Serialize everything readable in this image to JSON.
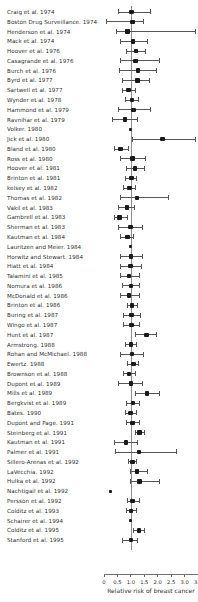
{
  "chart_data": {
    "type": "scatter",
    "plot_kind": "forest-plot",
    "title": "",
    "xlabel": "Relative risk of breast cancer",
    "ylabel": "",
    "xlim": [
      0,
      3.5
    ],
    "xticks": [
      0,
      0.5,
      1.0,
      1.5,
      2.0,
      2.5,
      3.0,
      3.5
    ],
    "xticklabels": [
      "0",
      "0.5",
      "1.0",
      "1.5",
      "2.0",
      "2.5",
      "3.0",
      "3.5"
    ],
    "reference_line": 1.0,
    "grid": false,
    "legend": "none",
    "point_label": "Relative risk estimate",
    "interval_label": "95% confidence interval",
    "studies": [
      {
        "label": "Craig et al. 1974",
        "rr": 1.03,
        "lo": 0.55,
        "hi": 1.72
      },
      {
        "label": "Boston Drug Surveillance. 1974",
        "rr": 1.06,
        "lo": 0.1,
        "hi": 1.45
      },
      {
        "label": "Henderson et al. 1974",
        "rr": 0.88,
        "lo": 0.48,
        "hi": 3.42
      },
      {
        "label": "Mack et al. 1974",
        "rr": 1.08,
        "lo": 0.62,
        "hi": 1.6
      },
      {
        "label": "Hoover et al. 1976",
        "rr": 1.2,
        "lo": 0.85,
        "hi": 1.55
      },
      {
        "label": "Casagrande et al. 1976",
        "rr": 1.17,
        "lo": 0.62,
        "hi": 2.08
      },
      {
        "label": "Burch et al. 1976",
        "rr": 1.27,
        "lo": 0.59,
        "hi": 1.94
      },
      {
        "label": "Byrd et al. 1977",
        "rr": 1.25,
        "lo": 0.7,
        "hi": 1.69
      },
      {
        "label": "Sartwell et al. 1977",
        "rr": 0.91,
        "lo": 0.7,
        "hi": 1.17
      },
      {
        "label": "Wynder et al. 1978",
        "rr": 1.05,
        "lo": 0.8,
        "hi": 1.28
      },
      {
        "label": "Hammond et al. 1979",
        "rr": 1.1,
        "lo": 0.52,
        "hi": 1.72
      },
      {
        "label": "Ravnihar et al. 1979",
        "rr": 0.78,
        "lo": 0.3,
        "hi": 1.26
      },
      {
        "label": "Volker. 1980",
        "rr": 1.0,
        "lo": null,
        "hi": null
      },
      {
        "label": "Jick et al. 1980",
        "rr": 2.18,
        "lo": 1.05,
        "hi": 3.42
      },
      {
        "label": "Bland et al. 1980",
        "rr": 0.62,
        "lo": 0.37,
        "hi": 0.92
      },
      {
        "label": "Ross et al. 1980",
        "rr": 1.06,
        "lo": 0.62,
        "hi": 1.55
      },
      {
        "label": "Hoover et al. 1981",
        "rr": 1.16,
        "lo": 0.82,
        "hi": 1.5
      },
      {
        "label": "Brinton et al. 1981",
        "rr": 1.02,
        "lo": 0.8,
        "hi": 1.22
      },
      {
        "label": "kelsey et al. 1982",
        "rr": 0.95,
        "lo": 0.72,
        "hi": 1.18
      },
      {
        "label": "Thomas et al. 1982",
        "rr": 1.23,
        "lo": 0.62,
        "hi": 2.4
      },
      {
        "label": "Vakil et al. 1983",
        "rr": 0.85,
        "lo": 0.55,
        "hi": 1.14
      },
      {
        "label": "Gambrell et al. 1983",
        "rr": 0.58,
        "lo": 0.37,
        "hi": 0.86
      },
      {
        "label": "Sherman et al. 1983",
        "rr": 0.98,
        "lo": 0.55,
        "hi": 1.42
      },
      {
        "label": "Kautman et al. 1984",
        "rr": 0.88,
        "lo": 0.6,
        "hi": 1.08
      },
      {
        "label": "Lauritzen and Meier. 1984",
        "rr": 0.98,
        "lo": null,
        "hi": null
      },
      {
        "label": "Horwitz and Stewart. 1984",
        "rr": 1.0,
        "lo": 0.6,
        "hi": 1.44
      },
      {
        "label": "Hiatt et al. 1984",
        "rr": 0.98,
        "lo": 0.62,
        "hi": 1.38
      },
      {
        "label": "Talamini et al. 1985",
        "rr": 0.94,
        "lo": 0.62,
        "hi": 1.3
      },
      {
        "label": "Nomura et al. 1986",
        "rr": 1.0,
        "lo": 0.68,
        "hi": 1.32
      },
      {
        "label": "McDonald et al. 1986",
        "rr": 0.92,
        "lo": 0.6,
        "hi": 1.3
      },
      {
        "label": "Brinton et al. 1986",
        "rr": 1.05,
        "lo": 0.86,
        "hi": 1.24
      },
      {
        "label": "Buring et al. 1987",
        "rr": 1.02,
        "lo": 0.72,
        "hi": 1.36
      },
      {
        "label": "Wingo et al. 1987",
        "rr": 1.03,
        "lo": 0.72,
        "hi": 1.32
      },
      {
        "label": "Hunt et al. 1987",
        "rr": 1.58,
        "lo": 1.16,
        "hi": 1.95
      },
      {
        "label": "Armstrong. 1988",
        "rr": 1.0,
        "lo": 0.8,
        "hi": 1.22
      },
      {
        "label": "Rohan and McMichael. 1988",
        "rr": 1.04,
        "lo": 0.62,
        "hi": 1.48
      },
      {
        "label": "Ewertz. 1988",
        "rr": 1.1,
        "lo": 0.88,
        "hi": 1.28
      },
      {
        "label": "Brownson et al. 1988",
        "rr": 0.94,
        "lo": 0.72,
        "hi": 1.16
      },
      {
        "label": "Dupont et al. 1989",
        "rr": 1.0,
        "lo": 0.55,
        "hi": 1.42
      },
      {
        "label": "Mills et al. 1989",
        "rr": 1.6,
        "lo": 1.18,
        "hi": 2.08
      },
      {
        "label": "Bergkvist et al. 1989",
        "rr": 1.08,
        "lo": 0.82,
        "hi": 1.32
      },
      {
        "label": "Bates. 1990",
        "rr": 0.98,
        "lo": 0.78,
        "hi": 1.2
      },
      {
        "label": "Dupont and Page. 1991",
        "rr": 1.06,
        "lo": 0.82,
        "hi": 1.3
      },
      {
        "label": "Steinberg et al. 1991",
        "rr": 1.32,
        "lo": 1.16,
        "hi": 1.5
      },
      {
        "label": "Kautman et al. 1991",
        "rr": 0.82,
        "lo": 0.4,
        "hi": 1.26
      },
      {
        "label": "Palmer et al. 1991",
        "rr": 1.3,
        "lo": 0.42,
        "hi": 2.68
      },
      {
        "label": "Sillero-Arenas et al. 1992",
        "rr": 1.06,
        "lo": 0.92,
        "hi": 1.2
      },
      {
        "label": "LaVecchia. 1992",
        "rr": 1.22,
        "lo": 1.0,
        "hi": 1.6
      },
      {
        "label": "Hulka et al. 1992",
        "rr": 1.32,
        "lo": 1.0,
        "hi": 2.08
      },
      {
        "label": "Nachtigail et al. 1992",
        "rr": 0.23,
        "lo": null,
        "hi": null
      },
      {
        "label": "Persson et al. 1992",
        "rr": 1.06,
        "lo": 0.86,
        "hi": 1.3
      },
      {
        "label": "Colditz et al. 1993",
        "rr": 1.0,
        "lo": 0.82,
        "hi": 1.2
      },
      {
        "label": "Schairer et al. 1994",
        "rr": 1.0,
        "lo": null,
        "hi": null
      },
      {
        "label": "Colditz et al. 1995",
        "rr": 1.3,
        "lo": 1.1,
        "hi": 1.52
      },
      {
        "label": "Stanford et al. 1995",
        "rr": 1.0,
        "lo": 0.7,
        "hi": 1.26
      }
    ]
  },
  "colors": {
    "point": "#1a1a1a",
    "interval": "#555555",
    "reference_line": "#8e8e8e",
    "axis": "#6f6f6f",
    "text": "#2f2f2f",
    "background": "#ffffff"
  }
}
